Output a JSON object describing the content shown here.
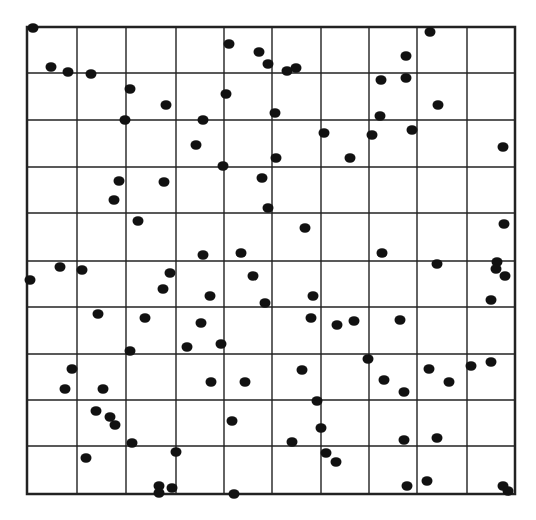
{
  "diagram": {
    "type": "grid-scatter",
    "frame": {
      "left": 27,
      "top": 27,
      "right": 515,
      "bottom": 494
    },
    "grid": {
      "columns": 10,
      "rows": 10,
      "vertical_lines_x": [
        27,
        77,
        126,
        176,
        224,
        272,
        321,
        369,
        417,
        467,
        515
      ],
      "horizontal_lines_y": [
        27,
        73,
        120,
        167,
        213,
        261,
        307,
        354,
        400,
        446,
        494
      ],
      "line_color": "#222222",
      "frame_width": 2.5,
      "line_width": 1.4
    },
    "dot": {
      "rx": 5.5,
      "ry": 4.8,
      "color": "#111111"
    },
    "points": [
      [
        33,
        28
      ],
      [
        51,
        67
      ],
      [
        68,
        72
      ],
      [
        91,
        74
      ],
      [
        130,
        89
      ],
      [
        125,
        120
      ],
      [
        166,
        105
      ],
      [
        229,
        44
      ],
      [
        259,
        52
      ],
      [
        268,
        64
      ],
      [
        226,
        94
      ],
      [
        203,
        120
      ],
      [
        196,
        145
      ],
      [
        287,
        71
      ],
      [
        296,
        68
      ],
      [
        275,
        113
      ],
      [
        276,
        158
      ],
      [
        223,
        166
      ],
      [
        262,
        178
      ],
      [
        268,
        208
      ],
      [
        324,
        133
      ],
      [
        350,
        158
      ],
      [
        372,
        135
      ],
      [
        381,
        80
      ],
      [
        406,
        56
      ],
      [
        406,
        78
      ],
      [
        380,
        116
      ],
      [
        412,
        130
      ],
      [
        430,
        32
      ],
      [
        438,
        105
      ],
      [
        503,
        147
      ],
      [
        119,
        181
      ],
      [
        164,
        182
      ],
      [
        114,
        200
      ],
      [
        138,
        221
      ],
      [
        305,
        228
      ],
      [
        382,
        253
      ],
      [
        504,
        224
      ],
      [
        60,
        267
      ],
      [
        82,
        270
      ],
      [
        30,
        280
      ],
      [
        203,
        255
      ],
      [
        241,
        253
      ],
      [
        170,
        273
      ],
      [
        163,
        289
      ],
      [
        253,
        276
      ],
      [
        210,
        296
      ],
      [
        265,
        303
      ],
      [
        313,
        296
      ],
      [
        437,
        264
      ],
      [
        497,
        262
      ],
      [
        496,
        269
      ],
      [
        505,
        276
      ],
      [
        491,
        300
      ],
      [
        98,
        314
      ],
      [
        145,
        318
      ],
      [
        201,
        323
      ],
      [
        130,
        351
      ],
      [
        187,
        347
      ],
      [
        221,
        344
      ],
      [
        311,
        318
      ],
      [
        337,
        325
      ],
      [
        354,
        321
      ],
      [
        400,
        320
      ],
      [
        72,
        369
      ],
      [
        65,
        389
      ],
      [
        103,
        389
      ],
      [
        211,
        382
      ],
      [
        245,
        382
      ],
      [
        302,
        370
      ],
      [
        368,
        359
      ],
      [
        384,
        380
      ],
      [
        404,
        392
      ],
      [
        429,
        369
      ],
      [
        449,
        382
      ],
      [
        471,
        366
      ],
      [
        491,
        362
      ],
      [
        96,
        411
      ],
      [
        110,
        417
      ],
      [
        115,
        425
      ],
      [
        132,
        443
      ],
      [
        176,
        452
      ],
      [
        232,
        421
      ],
      [
        317,
        401
      ],
      [
        321,
        428
      ],
      [
        292,
        442
      ],
      [
        404,
        440
      ],
      [
        437,
        438
      ],
      [
        86,
        458
      ],
      [
        326,
        453
      ],
      [
        336,
        462
      ],
      [
        159,
        486
      ],
      [
        172,
        488
      ],
      [
        159,
        493
      ],
      [
        234,
        494
      ],
      [
        407,
        486
      ],
      [
        427,
        481
      ],
      [
        503,
        486
      ],
      [
        508,
        491
      ]
    ]
  }
}
